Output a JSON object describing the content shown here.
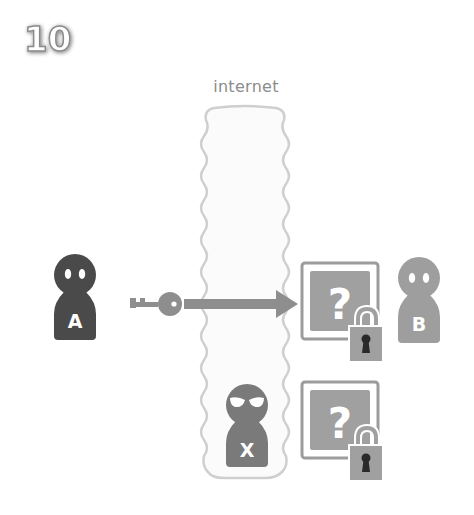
{
  "step": {
    "number": "10"
  },
  "internet": {
    "label": "internet"
  },
  "actors": {
    "sender": {
      "label": "A",
      "color": "#4a4a4a"
    },
    "receiver": {
      "label": "B",
      "color": "#9e9e9e"
    },
    "attacker": {
      "label": "X",
      "color": "#7a7a7a"
    }
  },
  "message_boxes": [
    {
      "symbol": "?",
      "state": "locked",
      "location": "receiver"
    },
    {
      "symbol": "?",
      "state": "locked",
      "location": "attacker"
    }
  ],
  "transfer": {
    "item": "key-icon",
    "direction": "A to B"
  },
  "colors": {
    "box_gray": "#a0a0a0",
    "box_border": "#9c9c9c",
    "internet_border": "#cfcfcf",
    "internet_fill": "#fbfbfb",
    "arrow_gray": "#8e8e8e",
    "keyhole": "#2a2a2a"
  }
}
